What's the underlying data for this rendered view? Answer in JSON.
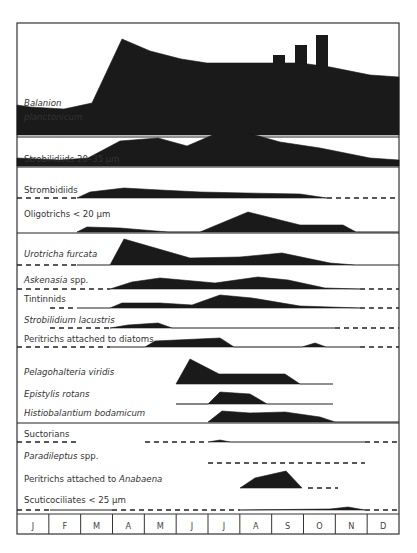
{
  "chart_data": {
    "type": "area",
    "title": "",
    "subtitle": "Seasonal abundance of ciliate taxa (kite diagram)",
    "xlabel": "",
    "ylabel": "",
    "x": [
      "J",
      "F",
      "M",
      "A",
      "M",
      "J",
      "J",
      "A",
      "S",
      "O",
      "N",
      "D"
    ],
    "legend": {
      "unit": "cells/mL",
      "entries": [
        {
          "label": "< 0.1",
          "style": "dashed"
        },
        {
          "label": "< 0.3",
          "style": "line"
        },
        {
          "label": "1",
          "style": "bar",
          "height": 10
        },
        {
          "label": "3",
          "style": "bar",
          "height": 20
        },
        {
          "label": "10",
          "style": "bar",
          "height": 30
        },
        {
          "label": "30",
          "style": "bar",
          "height": 40
        }
      ],
      "position": "top-right"
    },
    "series": [
      {
        "name": "Balanion planctonicum",
        "italic": true,
        "label_lines": [
          "Balanion",
          "planctonicum"
        ],
        "baseline": 135,
        "points": [
          [
            17,
            30
          ],
          [
            30,
            28
          ],
          [
            64,
            26
          ],
          [
            92,
            32
          ],
          [
            122,
            96
          ],
          [
            150,
            84
          ],
          [
            181,
            76
          ],
          [
            207,
            72
          ],
          [
            250,
            72
          ],
          [
            300,
            72
          ],
          [
            330,
            68
          ],
          [
            370,
            60
          ],
          [
            399,
            58
          ]
        ]
      },
      {
        "name": "Strobilidiids 20–35 µm",
        "italic": false,
        "label_lines": [
          "Strobilidiids 20–35 µm"
        ],
        "baseline": 166,
        "points": [
          [
            17,
            8
          ],
          [
            60,
            6
          ],
          [
            88,
            8
          ],
          [
            120,
            25
          ],
          [
            158,
            28
          ],
          [
            187,
            20
          ],
          [
            215,
            32
          ],
          [
            248,
            33
          ],
          [
            280,
            24
          ],
          [
            320,
            18
          ],
          [
            370,
            8
          ],
          [
            399,
            6
          ]
        ]
      },
      {
        "name": "Strombidiids",
        "italic": false,
        "label_lines": [
          "Strombidiids"
        ],
        "baseline": 198,
        "points": [
          [
            77,
            0
          ],
          [
            90,
            6
          ],
          [
            124,
            10
          ],
          [
            160,
            8
          ],
          [
            200,
            6
          ],
          [
            245,
            5
          ],
          [
            300,
            4
          ],
          [
            327,
            0
          ]
        ],
        "dashed_segments": [
          [
            17,
            77
          ],
          [
            327,
            399
          ]
        ]
      },
      {
        "name": "Oligotrichs < 20 µm",
        "italic": false,
        "label_lines": [
          "Oligotrichs < 20 µm"
        ],
        "baseline": 232,
        "points": [
          [
            77,
            0
          ],
          [
            87,
            5
          ],
          [
            120,
            4
          ],
          [
            168,
            0
          ],
          [
            200,
            0
          ],
          [
            248,
            20
          ],
          [
            300,
            7
          ],
          [
            343,
            7
          ],
          [
            356,
            0
          ]
        ],
        "solid_segments": [
          [
            356,
            399
          ]
        ]
      },
      {
        "name": "Urotricha furcata",
        "italic": true,
        "label_lines": [
          "Urotricha furcata"
        ],
        "baseline": 265,
        "points": [
          [
            110,
            0
          ],
          [
            124,
            26
          ],
          [
            190,
            7
          ],
          [
            240,
            8
          ],
          [
            282,
            12
          ],
          [
            330,
            2
          ],
          [
            355,
            0
          ]
        ],
        "dashed_segments": [
          [
            17,
            77
          ]
        ],
        "solid_segments": [
          [
            77,
            110
          ],
          [
            355,
            399
          ]
        ]
      },
      {
        "name": "Askenasia spp.",
        "italic": true,
        "label_lines": [
          "Askenasia spp."
        ],
        "baseline": 289,
        "points": [
          [
            110,
            0
          ],
          [
            132,
            7
          ],
          [
            160,
            11
          ],
          [
            215,
            6
          ],
          [
            258,
            12
          ],
          [
            288,
            9
          ],
          [
            325,
            1
          ],
          [
            360,
            0
          ]
        ],
        "dashed_segments": [
          [
            17,
            110
          ],
          [
            360,
            399
          ]
        ]
      },
      {
        "name": "Tintinnids",
        "italic": false,
        "label_lines": [
          "Tintinnids"
        ],
        "baseline": 308,
        "points": [
          [
            110,
            0
          ],
          [
            122,
            5
          ],
          [
            160,
            5
          ],
          [
            192,
            3
          ],
          [
            220,
            13
          ],
          [
            252,
            10
          ],
          [
            300,
            2
          ],
          [
            360,
            0
          ]
        ],
        "dashed_segments": [
          [
            50,
            77
          ],
          [
            360,
            399
          ]
        ],
        "solid_segments": [
          [
            77,
            110
          ]
        ]
      },
      {
        "name": "Strobilidium lacustris",
        "italic": true,
        "label_lines": [
          "Strobilidium lacustris"
        ],
        "baseline": 328,
        "points": [
          [
            110,
            0
          ],
          [
            128,
            3
          ],
          [
            158,
            5
          ],
          [
            172,
            0
          ]
        ],
        "dashed_segments": [
          [
            50,
            110
          ],
          [
            335,
            399
          ]
        ],
        "solid_segments": [
          [
            172,
            335
          ]
        ]
      },
      {
        "name": "Peritrichs attached to diatoms",
        "italic": false,
        "label_lines": [
          "Peritrichs attached to diatoms"
        ],
        "baseline": 347,
        "points": [
          [
            145,
            0
          ],
          [
            155,
            6
          ],
          [
            220,
            9
          ],
          [
            234,
            0
          ],
          [
            302,
            0
          ],
          [
            315,
            4
          ],
          [
            326,
            0
          ]
        ],
        "dashed_segments": [
          [
            17,
            110
          ],
          [
            360,
            399
          ]
        ],
        "solid_segments": [
          [
            110,
            145
          ],
          [
            326,
            360
          ]
        ]
      },
      {
        "name": "Pelagohalteria viridis",
        "italic": true,
        "label_lines": [
          "Pelagohalteria viridis"
        ],
        "baseline": 384,
        "points": [
          [
            176,
            0
          ],
          [
            190,
            25
          ],
          [
            219,
            10
          ],
          [
            285,
            10
          ],
          [
            300,
            0
          ]
        ],
        "solid_segments": [
          [
            300,
            333
          ]
        ]
      },
      {
        "name": "Epistylis rotans",
        "italic": true,
        "label_lines": [
          "Epistylis rotans"
        ],
        "baseline": 404,
        "points": [
          [
            208,
            0
          ],
          [
            220,
            12
          ],
          [
            250,
            10
          ],
          [
            267,
            0
          ]
        ],
        "solid_segments": [
          [
            176,
            208
          ],
          [
            267,
            333
          ]
        ]
      },
      {
        "name": "Histiobalantium bodamicum",
        "italic": true,
        "label_lines": [
          "Histiobalantium bodamicum"
        ],
        "baseline": 422,
        "points": [
          [
            208,
            0
          ],
          [
            222,
            11
          ],
          [
            250,
            9
          ],
          [
            285,
            10
          ],
          [
            320,
            5
          ],
          [
            335,
            0
          ]
        ],
        "solid_segments": [
          [
            335,
            399
          ]
        ]
      },
      {
        "name": "Suctorians",
        "italic": false,
        "label_lines": [
          "Suctorians"
        ],
        "baseline": 442,
        "points": [
          [
            208,
            0
          ],
          [
            220,
            2
          ],
          [
            230,
            0
          ]
        ],
        "dashed_segments": [
          [
            17,
            80
          ],
          [
            145,
            208
          ],
          [
            365,
            399
          ]
        ],
        "solid_segments": [
          [
            230,
            365
          ]
        ]
      },
      {
        "name": "Paradileptus spp.",
        "italic": true,
        "label_lines": [
          "Paradileptus spp."
        ],
        "baseline": 463,
        "points": [],
        "dashed_segments": [
          [
            208,
            365
          ]
        ]
      },
      {
        "name": "Peritrichs attached to Anabaena",
        "italic": false,
        "label_lines": [
          "Peritrichs attached to ",
          "Anabaena"
        ],
        "baseline": 488,
        "points": [
          [
            240,
            0
          ],
          [
            255,
            10
          ],
          [
            286,
            17
          ],
          [
            302,
            0
          ]
        ],
        "dashed_segments": [
          [
            308,
            338
          ]
        ]
      },
      {
        "name": "Scuticociliates < 25 µm",
        "italic": false,
        "label_lines": [
          "Scuticociliates < 25 µm"
        ],
        "baseline": 510,
        "points": [
          [
            240,
            0
          ],
          [
            330,
            1
          ],
          [
            348,
            3
          ],
          [
            365,
            0
          ]
        ],
        "dashed_segments": [
          [
            17,
            50
          ],
          [
            112,
            240
          ],
          [
            365,
            399
          ]
        ],
        "solid_segments": [
          [
            50,
            112
          ]
        ]
      }
    ],
    "separators_y": [
      137,
      167,
      233,
      423
    ],
    "frame": {
      "x": 17,
      "y": 23,
      "width": 382,
      "height": 511
    },
    "month_axis": {
      "top": 514,
      "bottom": 534
    }
  }
}
